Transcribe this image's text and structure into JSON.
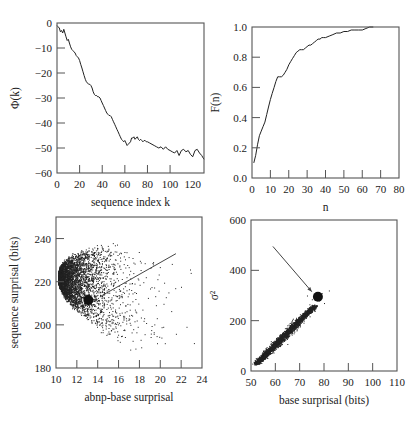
{
  "figure": {
    "background": "#ffffff",
    "ink_color": "#222222",
    "frame_color": "#555555"
  },
  "chart_data": [
    {
      "id": "phi",
      "type": "line",
      "title": "",
      "xlabel": "sequence index k",
      "ylabel": "Φ(k)",
      "xlim": [
        0,
        130
      ],
      "ylim": [
        -60,
        0
      ],
      "xticks": [
        0,
        20,
        40,
        60,
        80,
        100,
        120
      ],
      "yticks": [
        0,
        -10,
        -20,
        -30,
        -40,
        -50,
        -60
      ],
      "grid": false,
      "frame_px": {
        "left": 57,
        "top": 23,
        "right": 204,
        "bottom": 173
      },
      "x": [
        0,
        1,
        2,
        3,
        4,
        5,
        6,
        7,
        8,
        9,
        10,
        11,
        12,
        13,
        14,
        15,
        16,
        17,
        18,
        19,
        20,
        21,
        22,
        23,
        24,
        25,
        26,
        27,
        28,
        29,
        30,
        31,
        32,
        33,
        34,
        35,
        36,
        37,
        38,
        39,
        40,
        41,
        42,
        43,
        44,
        45,
        46,
        47,
        48,
        49,
        50,
        51,
        52,
        53,
        54,
        55,
        56,
        57,
        58,
        59,
        60,
        61,
        62,
        63,
        64,
        65,
        66,
        67,
        68,
        69,
        70,
        71,
        72,
        73,
        74,
        75,
        76,
        77,
        78,
        79,
        80,
        82,
        84,
        86,
        88,
        90,
        92,
        94,
        96,
        98,
        100,
        102,
        104,
        106,
        108,
        110,
        112,
        114,
        116,
        118,
        120,
        122,
        124,
        126,
        128,
        130
      ],
      "values": [
        -1,
        -1.5,
        -2,
        -3.5,
        -3,
        -4,
        -2.5,
        -4,
        -5.5,
        -7,
        -6.5,
        -8,
        -9.5,
        -10.5,
        -11,
        -11.5,
        -12,
        -13,
        -13.5,
        -14,
        -15,
        -16.5,
        -18,
        -19.5,
        -21,
        -22.5,
        -23.5,
        -24,
        -24.5,
        -24.5,
        -25,
        -26,
        -27.5,
        -28.5,
        -29,
        -29,
        -29.5,
        -29.5,
        -30,
        -31,
        -32,
        -33,
        -34,
        -35,
        -36,
        -36.5,
        -37,
        -37,
        -37.5,
        -38.5,
        -39.5,
        -40.5,
        -41.5,
        -42.5,
        -43.5,
        -44.5,
        -45.5,
        -46.5,
        -47,
        -47.5,
        -47,
        -48,
        -49,
        -48.5,
        -48,
        -47.5,
        -46,
        -46,
        -45.5,
        -46.5,
        -46,
        -45.5,
        -46.5,
        -47,
        -46.5,
        -47,
        -47.5,
        -47,
        -47,
        -47.5,
        -47.5,
        -48,
        -48.5,
        -49,
        -49.5,
        -50,
        -49.5,
        -50.5,
        -49.5,
        -50.5,
        -51,
        -51.5,
        -52,
        -51,
        -53,
        -51,
        -50.5,
        -51.5,
        -51,
        -52.5,
        -53.5,
        -51,
        -50.5,
        -52,
        -53,
        -54.5
      ]
    },
    {
      "id": "cdf",
      "type": "line",
      "title": "",
      "xlabel": "n",
      "ylabel": "F(n)",
      "xlim": [
        0,
        80
      ],
      "ylim": [
        0.0,
        1.0
      ],
      "xticks": [
        0,
        10,
        20,
        30,
        40,
        50,
        60,
        70,
        80
      ],
      "yticks": [
        0.0,
        0.2,
        0.4,
        0.6,
        0.8,
        1.0
      ],
      "ytick_labels": [
        "0.0",
        "0.2",
        "0.4",
        "0.6",
        "0.8",
        "1.0"
      ],
      "grid": false,
      "frame_px": {
        "left": 252,
        "top": 27,
        "right": 399,
        "bottom": 178
      },
      "x": [
        1,
        2,
        3,
        4,
        5,
        6,
        7,
        8,
        9,
        10,
        11,
        12,
        13,
        14,
        15,
        16,
        17,
        18,
        19,
        20,
        21,
        22,
        23,
        24,
        25,
        26,
        27,
        28,
        29,
        30,
        31,
        32,
        33,
        34,
        35,
        36,
        37,
        38,
        39,
        40,
        42,
        44,
        46,
        48,
        50,
        52,
        54,
        56,
        58,
        60,
        62,
        64,
        66
      ],
      "values": [
        0.1,
        0.15,
        0.22,
        0.28,
        0.31,
        0.34,
        0.37,
        0.42,
        0.47,
        0.52,
        0.56,
        0.6,
        0.64,
        0.67,
        0.67,
        0.67,
        0.68,
        0.7,
        0.72,
        0.75,
        0.77,
        0.79,
        0.81,
        0.83,
        0.84,
        0.85,
        0.85,
        0.85,
        0.86,
        0.87,
        0.88,
        0.88,
        0.89,
        0.9,
        0.91,
        0.92,
        0.92,
        0.93,
        0.93,
        0.93,
        0.94,
        0.95,
        0.96,
        0.96,
        0.97,
        0.97,
        0.98,
        0.98,
        0.98,
        0.98,
        0.99,
        1.0,
        1.0
      ]
    },
    {
      "id": "surprisal-scatter",
      "type": "scatter",
      "title": "",
      "xlabel": "abnp-base surprisal",
      "ylabel": "sequence surprisal (bits)",
      "xlim": [
        10,
        24
      ],
      "ylim": [
        180,
        250
      ],
      "xticks": [
        10,
        12,
        14,
        16,
        18,
        20,
        22,
        24
      ],
      "yticks": [
        180,
        200,
        220,
        240
      ],
      "grid": false,
      "frame_px": {
        "left": 56,
        "top": 217,
        "right": 202,
        "bottom": 368
      },
      "description": "Dense cloud of ~4000 points; apex near (10.3, 222); dense core 10.5–14 on x, 205–238 on y; sparse tail extending to x≈22 between y 190–243.",
      "cloud": {
        "apex_x": 10.2,
        "center_y": 222,
        "point_count": 4000
      },
      "highlight_point": {
        "x": 13.1,
        "y": 211.5,
        "marker": "large-filled-circle"
      },
      "annotation_line": {
        "x1": 14.2,
        "y1": 213,
        "x2": 21.5,
        "y2": 233
      }
    },
    {
      "id": "variance-scatter",
      "type": "scatter",
      "title": "",
      "xlabel": "base surprisal (bits)",
      "ylabel": "σ²",
      "xlim": [
        50,
        110
      ],
      "ylim": [
        0,
        600
      ],
      "xticks": [
        50,
        60,
        70,
        80,
        90,
        100,
        110
      ],
      "yticks": [
        0,
        200,
        400,
        600
      ],
      "grid": false,
      "frame_px": {
        "left": 251,
        "top": 220,
        "right": 397,
        "bottom": 371
      },
      "description": "Elongated linear cluster from (52, 30) to (76, 260), widening in the middle; sparse outliers up to (82, 320).",
      "cloud": {
        "start": [
          52,
          30
        ],
        "end": [
          76,
          260
        ],
        "point_count": 2500
      },
      "highlight_point": {
        "x": 77.5,
        "y": 295,
        "marker": "large-filled-circle"
      },
      "annotation_arrow": {
        "x1": 59,
        "y1": 495,
        "x2": 75,
        "y2": 315
      }
    }
  ]
}
